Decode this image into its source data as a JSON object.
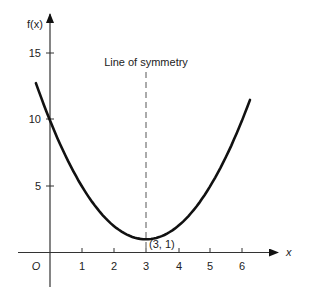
{
  "chart_data": {
    "type": "line",
    "title": "",
    "function": "f(x) = (x - 3)^2 + 1",
    "xlabel": "x",
    "ylabel": "f(x)",
    "origin_label": "O",
    "xlim": [
      -1,
      7
    ],
    "ylim": [
      -2,
      17
    ],
    "x_ticks": [
      1,
      2,
      3,
      4,
      5,
      6
    ],
    "x_tick_labels": [
      "1",
      "2",
      "3",
      "4",
      "5",
      "6"
    ],
    "y_ticks": [
      5,
      10,
      15
    ],
    "y_tick_labels": [
      "5",
      "10",
      "15"
    ],
    "grid": false,
    "series": [
      {
        "name": "f(x)",
        "x": [
          -0.44,
          0,
          0.5,
          1,
          1.5,
          2,
          2.5,
          3,
          3.5,
          4,
          4.5,
          5,
          5.5,
          6,
          6.25
        ],
        "values": [
          12.8,
          10,
          7.25,
          5,
          3.25,
          2,
          1.25,
          1,
          1.25,
          2,
          3.25,
          5,
          7.25,
          10,
          11.56
        ]
      }
    ],
    "annotations": [
      {
        "text": "Line of symmetry",
        "type": "dashed-vertical-line",
        "x": 3
      },
      {
        "text": "(3, 1)",
        "type": "point-label",
        "x": 3,
        "y": 1
      }
    ]
  }
}
